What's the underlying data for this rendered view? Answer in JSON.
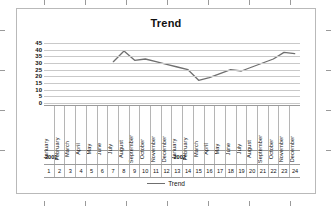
{
  "chart_object": {
    "title": "Trend",
    "legend_label": "Trend",
    "legend_swatch_name": "trend-line-swatch"
  },
  "chart_data": {
    "type": "line",
    "title": "Trend",
    "xlabel": "",
    "ylabel": "",
    "ylim": [
      0,
      45
    ],
    "grid": true,
    "legend_position": "bottom",
    "legend": [
      "Trend"
    ],
    "categories": [
      "January",
      "February",
      "March",
      "April",
      "May",
      "June",
      "July",
      "August",
      "September",
      "October",
      "November",
      "December",
      "January",
      "February",
      "March",
      "April",
      "May",
      "June",
      "July",
      "August",
      "September",
      "October",
      "November",
      "December"
    ],
    "index_labels": [
      "1",
      "2",
      "3",
      "4",
      "5",
      "6",
      "7",
      "8",
      "9",
      "10",
      "11",
      "12",
      "13",
      "14",
      "15",
      "16",
      "17",
      "18",
      "19",
      "20",
      "21",
      "22",
      "23",
      "24"
    ],
    "year_groups": [
      {
        "label": "2001",
        "start_index": 1,
        "span": 12
      },
      {
        "label": "2002",
        "start_index": 13,
        "span": 12
      }
    ],
    "year_cells": [
      "2001",
      "",
      "",
      "",
      "",
      "",
      "",
      "",
      "",
      "",
      "",
      "",
      "2002",
      "",
      "",
      "",
      "",
      "",
      "",
      "",
      "",
      "",
      "",
      ""
    ],
    "yticks": [
      0,
      5,
      10,
      15,
      20,
      25,
      30,
      35,
      40,
      45
    ],
    "series": [
      {
        "name": "Trend",
        "color": "#6f6f6f",
        "values": [
          null,
          null,
          null,
          null,
          null,
          null,
          31,
          39,
          32,
          33,
          31,
          29,
          27,
          25,
          17,
          19,
          22,
          25,
          24,
          27,
          30,
          33,
          38,
          37
        ]
      }
    ]
  }
}
